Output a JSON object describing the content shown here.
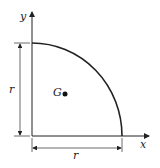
{
  "diagram": {
    "labels": {
      "y_axis": "y",
      "x_axis": "x",
      "centroid": "G",
      "vertical_dimension": "r",
      "horizontal_dimension": "r"
    },
    "colors": {
      "stroke": "#222222",
      "background": "#ffffff"
    }
  }
}
